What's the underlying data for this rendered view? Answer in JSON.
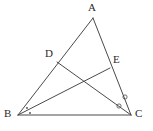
{
  "figure": {
    "name": "triangle-with-cevians",
    "background_color": "#ffffff",
    "stroke_color": "#4a4a4a",
    "label_color": "#2b2b2b",
    "width": 153,
    "height": 131
  },
  "labels": {
    "A": "A",
    "B": "B",
    "C": "C",
    "D": "D",
    "E": "E"
  },
  "chart_data": {
    "type": "diagram",
    "title": "",
    "points": [
      {
        "id": "A",
        "label": "A",
        "x": 93,
        "y": 18
      },
      {
        "id": "B",
        "label": "B",
        "x": 18,
        "y": 115
      },
      {
        "id": "C",
        "label": "C",
        "x": 131,
        "y": 115
      },
      {
        "id": "D",
        "label": "D",
        "x": 57,
        "y": 62
      },
      {
        "id": "E",
        "label": "E",
        "x": 110,
        "y": 68
      }
    ],
    "segments": [
      {
        "id": "AB",
        "from": "A",
        "to": "B"
      },
      {
        "id": "AC",
        "from": "A",
        "to": "C"
      },
      {
        "id": "BC",
        "from": "B",
        "to": "C"
      },
      {
        "id": "BE",
        "from": "B",
        "to": "E"
      },
      {
        "id": "DC",
        "from": "D",
        "to": "C"
      }
    ],
    "angle_marks": [
      {
        "id": "angle-B-1",
        "vertex": "B",
        "glyph": "dot",
        "x": 27,
        "y": 108
      },
      {
        "id": "angle-B-2",
        "vertex": "B",
        "glyph": "dot",
        "x": 30,
        "y": 113
      },
      {
        "id": "angle-C-1",
        "vertex": "C",
        "glyph": "circle",
        "x": 125,
        "y": 97
      },
      {
        "id": "angle-C-2",
        "vertex": "C",
        "glyph": "circle",
        "x": 119,
        "y": 106
      }
    ]
  }
}
